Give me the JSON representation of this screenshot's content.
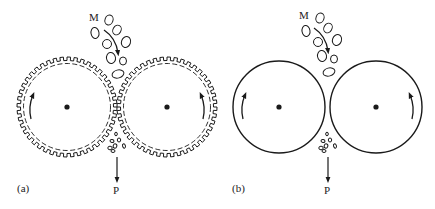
{
  "figure": {
    "panels": [
      {
        "id": "a",
        "label": "(a)",
        "roller_type": "toothed",
        "feed_label": "M",
        "product_label": "P"
      },
      {
        "id": "b",
        "label": "(b)",
        "roller_type": "smooth",
        "feed_label": "M",
        "product_label": "P"
      }
    ]
  },
  "colors": {
    "stroke": "#1a1a1a",
    "background": "#ffffff"
  }
}
